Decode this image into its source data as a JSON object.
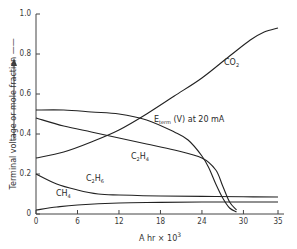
{
  "chart_data": {
    "type": "line",
    "title": "",
    "xlabel": "A hr × 10^3",
    "ylabel": "Terminal voltage or mole fraction",
    "xlim": [
      0,
      35
    ],
    "ylim": [
      0,
      1.0
    ],
    "grid": false,
    "legend": "inline labels",
    "x_ticks": [
      "0",
      "6",
      "12",
      "18",
      "24",
      "30",
      "35"
    ],
    "y_ticks": [
      "0",
      "0.2",
      "0.4",
      "0.6",
      "0.8",
      "1.0"
    ],
    "series": [
      {
        "name": "CO2",
        "label_main": "CO",
        "label_sub": "2",
        "x": [
          0,
          4,
          8,
          12,
          16,
          20,
          24,
          28,
          31,
          33,
          35
        ],
        "y": [
          0.28,
          0.31,
          0.36,
          0.42,
          0.5,
          0.59,
          0.68,
          0.79,
          0.87,
          0.91,
          0.93
        ]
      },
      {
        "name": "E_term (V) at 20 mA",
        "label_main": "E",
        "label_sub": "term",
        "label_rest": " (V) at 20 mA",
        "x": [
          0,
          4,
          8,
          12,
          16,
          20,
          22,
          24,
          25,
          26,
          27,
          28,
          29
        ],
        "y": [
          0.52,
          0.52,
          0.51,
          0.5,
          0.47,
          0.41,
          0.37,
          0.29,
          0.23,
          0.15,
          0.08,
          0.03,
          0.01
        ]
      },
      {
        "name": "C2H4",
        "label_main": "C",
        "label_sub": "2",
        "label_main2": "H",
        "label_sub2": "4",
        "x": [
          0,
          4,
          8,
          12,
          16,
          20,
          24,
          26,
          27,
          28,
          29
        ],
        "y": [
          0.48,
          0.44,
          0.41,
          0.38,
          0.35,
          0.32,
          0.28,
          0.22,
          0.14,
          0.06,
          0.02
        ]
      },
      {
        "name": "C2H6",
        "label_main": "C",
        "label_sub": "2",
        "label_main2": "H",
        "label_sub2": "6",
        "x": [
          0,
          3,
          6,
          9,
          12,
          18,
          24,
          30,
          35
        ],
        "y": [
          0.2,
          0.15,
          0.12,
          0.1,
          0.095,
          0.09,
          0.088,
          0.086,
          0.085
        ]
      },
      {
        "name": "CH4",
        "label_main": "CH",
        "label_sub": "4",
        "x": [
          0,
          3,
          6,
          12,
          18,
          24,
          30,
          35
        ],
        "y": [
          0.02,
          0.035,
          0.045,
          0.055,
          0.058,
          0.06,
          0.06,
          0.06
        ]
      }
    ]
  },
  "labels": {
    "ytitle": "Terminal voltage or mole fraction ——",
    "xtitle_main": "A hr × 10",
    "xtitle_sup": "3"
  }
}
